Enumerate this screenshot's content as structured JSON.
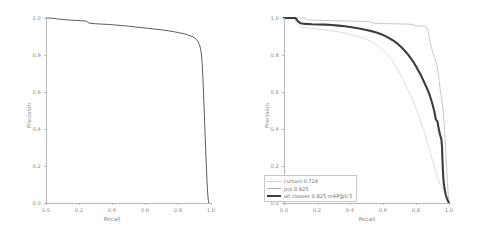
{
  "figure": {
    "background": "#ffffff",
    "axis_color": "#b9b9b9",
    "text_color": "#8a8a8a"
  },
  "chart_data": [
    {
      "id": "left-pr-curve",
      "type": "line",
      "title": "",
      "xlabel": "Recall",
      "ylabel": "Precision",
      "xlim": [
        0.0,
        1.0
      ],
      "ylim": [
        0.0,
        1.0
      ],
      "xticks": [
        "0.0",
        "0.2",
        "0.4",
        "0.6",
        "0.8",
        "1.0"
      ],
      "yticks": [
        "0.0",
        "0.2",
        "0.4",
        "0.6",
        "0.8",
        "1.0"
      ],
      "grid": false,
      "legend": null,
      "series": [
        {
          "name": "all classes",
          "color": "#4a4a4a",
          "width": 0.9,
          "points": [
            [
              0.0,
              1.0
            ],
            [
              0.02,
              1.0
            ],
            [
              0.045,
              0.998
            ],
            [
              0.07,
              0.995
            ],
            [
              0.1,
              0.992
            ],
            [
              0.14,
              0.989
            ],
            [
              0.18,
              0.987
            ],
            [
              0.215,
              0.985
            ],
            [
              0.245,
              0.983
            ],
            [
              0.262,
              0.972
            ],
            [
              0.3,
              0.969
            ],
            [
              0.34,
              0.967
            ],
            [
              0.38,
              0.965
            ],
            [
              0.42,
              0.962
            ],
            [
              0.46,
              0.959
            ],
            [
              0.5,
              0.956
            ],
            [
              0.54,
              0.952
            ],
            [
              0.58,
              0.948
            ],
            [
              0.62,
              0.944
            ],
            [
              0.66,
              0.94
            ],
            [
              0.7,
              0.936
            ],
            [
              0.74,
              0.931
            ],
            [
              0.78,
              0.925
            ],
            [
              0.81,
              0.92
            ],
            [
              0.84,
              0.914
            ],
            [
              0.865,
              0.907
            ],
            [
              0.885,
              0.9
            ],
            [
              0.9,
              0.893
            ],
            [
              0.912,
              0.884
            ],
            [
              0.922,
              0.872
            ],
            [
              0.93,
              0.856
            ],
            [
              0.936,
              0.836
            ],
            [
              0.941,
              0.81
            ],
            [
              0.945,
              0.775
            ],
            [
              0.948,
              0.73
            ],
            [
              0.951,
              0.675
            ],
            [
              0.954,
              0.61
            ],
            [
              0.957,
              0.54
            ],
            [
              0.96,
              0.47
            ],
            [
              0.963,
              0.4
            ],
            [
              0.966,
              0.33
            ],
            [
              0.969,
              0.26
            ],
            [
              0.972,
              0.195
            ],
            [
              0.975,
              0.135
            ],
            [
              0.978,
              0.08
            ],
            [
              0.981,
              0.04
            ],
            [
              0.984,
              0.012
            ],
            [
              0.986,
              0.0
            ]
          ]
        }
      ]
    },
    {
      "id": "right-pr-curve",
      "type": "line",
      "title": "",
      "xlabel": "Recall",
      "ylabel": "Precision",
      "xlim": [
        0.0,
        1.0
      ],
      "ylim": [
        0.0,
        1.0
      ],
      "xticks": [
        "0.0",
        "0.2",
        "0.4",
        "0.6",
        "0.8",
        "1.0"
      ],
      "yticks": [
        "0.0",
        "0.2",
        "0.4",
        "0.6",
        "0.8",
        "1.0"
      ],
      "grid": false,
      "legend": {
        "position": "lower-left",
        "entries": [
          {
            "label": "curtain 0.724",
            "color": "#cfcfcf",
            "width": 0.7
          },
          {
            "label": "pot 0.925",
            "color": "#b0b0b0",
            "width": 0.7
          },
          {
            "label": "all classes 0.825 mAP@0.5",
            "color": "#3d3d3d",
            "width": 2.1
          }
        ]
      },
      "series": [
        {
          "name": "curtain 0.724",
          "ap": 0.724,
          "color": "#cfcfcf",
          "width": 0.7,
          "points": [
            [
              0.0,
              1.0
            ],
            [
              0.06,
              1.0
            ],
            [
              0.075,
              0.975
            ],
            [
              0.09,
              0.955
            ],
            [
              0.11,
              0.95
            ],
            [
              0.15,
              0.946
            ],
            [
              0.19,
              0.942
            ],
            [
              0.23,
              0.938
            ],
            [
              0.27,
              0.934
            ],
            [
              0.31,
              0.928
            ],
            [
              0.35,
              0.922
            ],
            [
              0.39,
              0.914
            ],
            [
              0.43,
              0.905
            ],
            [
              0.46,
              0.897
            ],
            [
              0.49,
              0.888
            ],
            [
              0.52,
              0.876
            ],
            [
              0.55,
              0.862
            ],
            [
              0.575,
              0.846
            ],
            [
              0.6,
              0.826
            ],
            [
              0.625,
              0.802
            ],
            [
              0.65,
              0.775
            ],
            [
              0.672,
              0.746
            ],
            [
              0.692,
              0.716
            ],
            [
              0.71,
              0.686
            ],
            [
              0.728,
              0.655
            ],
            [
              0.745,
              0.624
            ],
            [
              0.76,
              0.596
            ],
            [
              0.775,
              0.566
            ],
            [
              0.79,
              0.534
            ],
            [
              0.805,
              0.5
            ],
            [
              0.818,
              0.468
            ],
            [
              0.83,
              0.436
            ],
            [
              0.842,
              0.404
            ],
            [
              0.854,
              0.372
            ],
            [
              0.865,
              0.34
            ],
            [
              0.876,
              0.308
            ],
            [
              0.886,
              0.276
            ],
            [
              0.896,
              0.244
            ],
            [
              0.906,
              0.212
            ],
            [
              0.915,
              0.182
            ],
            [
              0.924,
              0.155
            ],
            [
              0.932,
              0.132
            ],
            [
              0.94,
              0.114
            ],
            [
              0.948,
              0.1
            ],
            [
              0.956,
              0.088
            ],
            [
              0.964,
              0.074
            ],
            [
              0.972,
              0.058
            ],
            [
              0.98,
              0.04
            ],
            [
              0.99,
              0.02
            ],
            [
              1.0,
              0.0
            ]
          ]
        },
        {
          "name": "pot 0.925",
          "ap": 0.925,
          "color": "#b0b0b0",
          "width": 0.7,
          "points": [
            [
              0.0,
              1.0
            ],
            [
              0.12,
              1.0
            ],
            [
              0.14,
              0.99
            ],
            [
              0.18,
              0.988
            ],
            [
              0.23,
              0.987
            ],
            [
              0.28,
              0.986
            ],
            [
              0.33,
              0.985
            ],
            [
              0.38,
              0.984
            ],
            [
              0.42,
              0.983
            ],
            [
              0.46,
              0.982
            ],
            [
              0.5,
              0.981
            ],
            [
              0.52,
              0.979
            ],
            [
              0.545,
              0.972
            ],
            [
              0.56,
              0.971
            ],
            [
              0.6,
              0.97
            ],
            [
              0.65,
              0.969
            ],
            [
              0.7,
              0.968
            ],
            [
              0.74,
              0.967
            ],
            [
              0.77,
              0.966
            ],
            [
              0.79,
              0.96
            ],
            [
              0.805,
              0.958
            ],
            [
              0.83,
              0.957
            ],
            [
              0.85,
              0.956
            ],
            [
              0.862,
              0.95
            ],
            [
              0.872,
              0.93
            ],
            [
              0.88,
              0.9
            ],
            [
              0.886,
              0.87
            ],
            [
              0.892,
              0.845
            ],
            [
              0.898,
              0.825
            ],
            [
              0.904,
              0.805
            ],
            [
              0.91,
              0.79
            ],
            [
              0.916,
              0.775
            ],
            [
              0.922,
              0.76
            ],
            [
              0.928,
              0.742
            ],
            [
              0.932,
              0.718
            ],
            [
              0.936,
              0.69
            ],
            [
              0.94,
              0.662
            ],
            [
              0.944,
              0.632
            ],
            [
              0.948,
              0.605
            ],
            [
              0.952,
              0.58
            ],
            [
              0.956,
              0.556
            ],
            [
              0.96,
              0.53
            ],
            [
              0.964,
              0.5
            ],
            [
              0.968,
              0.46
            ],
            [
              0.972,
              0.41
            ],
            [
              0.976,
              0.35
            ],
            [
              0.98,
              0.285
            ],
            [
              0.984,
              0.215
            ],
            [
              0.988,
              0.15
            ],
            [
              0.992,
              0.09
            ],
            [
              0.996,
              0.04
            ],
            [
              1.0,
              0.0
            ]
          ]
        },
        {
          "name": "all classes 0.825 mAP@0.5",
          "ap": 0.825,
          "color": "#3d3d3d",
          "width": 2.1,
          "points": [
            [
              0.0,
              1.0
            ],
            [
              0.07,
              1.0
            ],
            [
              0.085,
              0.982
            ],
            [
              0.1,
              0.972
            ],
            [
              0.13,
              0.968
            ],
            [
              0.17,
              0.966
            ],
            [
              0.21,
              0.965
            ],
            [
              0.25,
              0.964
            ],
            [
              0.29,
              0.962
            ],
            [
              0.33,
              0.959
            ],
            [
              0.37,
              0.955
            ],
            [
              0.41,
              0.95
            ],
            [
              0.44,
              0.946
            ],
            [
              0.47,
              0.941
            ],
            [
              0.5,
              0.935
            ],
            [
              0.53,
              0.929
            ],
            [
              0.56,
              0.921
            ],
            [
              0.59,
              0.912
            ],
            [
              0.615,
              0.902
            ],
            [
              0.64,
              0.89
            ],
            [
              0.665,
              0.876
            ],
            [
              0.69,
              0.86
            ],
            [
              0.712,
              0.842
            ],
            [
              0.732,
              0.823
            ],
            [
              0.752,
              0.802
            ],
            [
              0.77,
              0.78
            ],
            [
              0.788,
              0.757
            ],
            [
              0.804,
              0.733
            ],
            [
              0.818,
              0.71
            ],
            [
              0.832,
              0.686
            ],
            [
              0.845,
              0.662
            ],
            [
              0.856,
              0.64
            ],
            [
              0.866,
              0.62
            ],
            [
              0.876,
              0.6
            ],
            [
              0.884,
              0.58
            ],
            [
              0.892,
              0.558
            ],
            [
              0.9,
              0.534
            ],
            [
              0.906,
              0.512
            ],
            [
              0.912,
              0.492
            ],
            [
              0.916,
              0.47
            ],
            [
              0.92,
              0.452
            ],
            [
              0.925,
              0.446
            ],
            [
              0.93,
              0.442
            ],
            [
              0.934,
              0.42
            ],
            [
              0.938,
              0.4
            ],
            [
              0.942,
              0.382
            ],
            [
              0.946,
              0.368
            ],
            [
              0.95,
              0.356
            ],
            [
              0.954,
              0.344
            ],
            [
              0.958,
              0.3
            ],
            [
              0.96,
              0.24
            ],
            [
              0.963,
              0.18
            ],
            [
              0.966,
              0.13
            ],
            [
              0.97,
              0.095
            ],
            [
              0.975,
              0.068
            ],
            [
              0.98,
              0.046
            ],
            [
              0.986,
              0.028
            ],
            [
              0.993,
              0.012
            ],
            [
              1.0,
              0.0
            ]
          ]
        }
      ]
    }
  ]
}
